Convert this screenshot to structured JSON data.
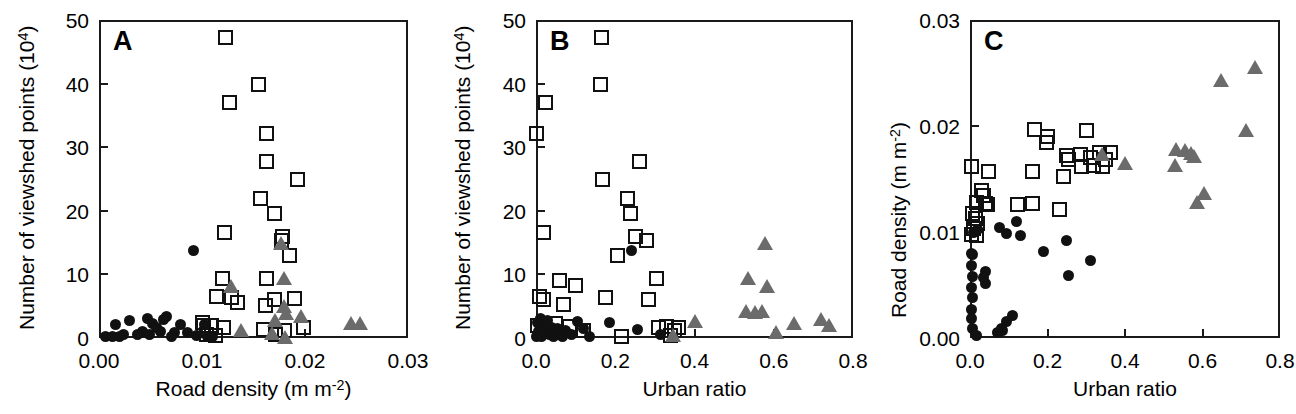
{
  "figure": {
    "background": "#ffffff",
    "marker_colors": {
      "square_outline": "#111111",
      "circle_fill": "#111111",
      "triangle_fill": "#6b6b6b",
      "axis": "#1a1a1a"
    }
  },
  "chart_data": [
    {
      "type": "scatter",
      "panel_label": "A",
      "title": "",
      "xlabel": "Road density (m m-2)",
      "xlabel_base": "Road density (m m",
      "xlabel_sup": "-2",
      "xlabel_tail": ")",
      "ylabel": "Number of viewshed points (104)",
      "ylabel_base": "Number of viewshed points (10",
      "ylabel_sup": "4",
      "ylabel_tail": ")",
      "xlim": [
        0.0,
        0.03
      ],
      "ylim": [
        0,
        50
      ],
      "xticks": [
        0.0,
        0.01,
        0.02,
        0.03
      ],
      "xtick_labels": [
        "0.00",
        "0.01",
        "0.02",
        "0.03"
      ],
      "yticks": [
        0,
        10,
        20,
        30,
        40,
        50
      ],
      "ytick_labels": [
        "0",
        "10",
        "20",
        "30",
        "40",
        "50"
      ],
      "grid": false,
      "legend": "none",
      "series": [
        {
          "name": "open-square",
          "marker": "square",
          "points": [
            [
              0.0123,
              47.2
            ],
            [
              0.0155,
              39.8
            ],
            [
              0.0127,
              37.0
            ],
            [
              0.0163,
              32.2
            ],
            [
              0.0163,
              27.8
            ],
            [
              0.0193,
              25.0
            ],
            [
              0.0157,
              21.9
            ],
            [
              0.017,
              19.6
            ],
            [
              0.0122,
              16.6
            ],
            [
              0.0178,
              16.0
            ],
            [
              0.0177,
              15.4
            ],
            [
              0.0185,
              12.9
            ],
            [
              0.012,
              9.3
            ],
            [
              0.0163,
              9.4
            ],
            [
              0.0114,
              6.5
            ],
            [
              0.0129,
              6.3
            ],
            [
              0.017,
              6.1
            ],
            [
              0.019,
              6.2
            ],
            [
              0.0134,
              5.6
            ],
            [
              0.0162,
              5.1
            ],
            [
              0.01,
              2.5
            ],
            [
              0.0101,
              2.0
            ],
            [
              0.0109,
              1.9
            ],
            [
              0.0121,
              1.6
            ],
            [
              0.016,
              1.3
            ],
            [
              0.018,
              1.2
            ],
            [
              0.0199,
              1.7
            ],
            [
              0.0104,
              0.6
            ],
            [
              0.0113,
              0.4
            ],
            [
              0.0171,
              0.5
            ]
          ]
        },
        {
          "name": "filled-circle",
          "marker": "circle",
          "points": [
            [
              0.0092,
              13.7
            ],
            [
              0.0066,
              3.4
            ],
            [
              0.0047,
              3.0
            ],
            [
              0.0063,
              2.9
            ],
            [
              0.003,
              2.8
            ],
            [
              0.0016,
              2.2
            ],
            [
              0.0052,
              2.3
            ],
            [
              0.0079,
              2.2
            ],
            [
              0.0056,
              1.6
            ],
            [
              0.0102,
              2.2
            ],
            [
              0.0042,
              1.1
            ],
            [
              0.006,
              1.0
            ],
            [
              0.0073,
              0.9
            ],
            [
              0.0086,
              0.8
            ],
            [
              0.0024,
              0.6
            ],
            [
              0.0037,
              0.5
            ],
            [
              0.0049,
              0.5
            ],
            [
              0.0006,
              0.2
            ],
            [
              0.0013,
              0.2
            ],
            [
              0.002,
              0.2
            ],
            [
              0.0095,
              0.4
            ],
            [
              0.0105,
              0.3
            ],
            [
              0.011,
              0.2
            ],
            [
              0.007,
              0.3
            ]
          ]
        },
        {
          "name": "filled-triangle",
          "marker": "triangle",
          "points": [
            [
              0.018,
              9.4
            ],
            [
              0.0128,
              8.1
            ],
            [
              0.0177,
              14.9
            ],
            [
              0.018,
              5.1
            ],
            [
              0.0182,
              4.0
            ],
            [
              0.0196,
              3.4
            ],
            [
              0.0171,
              2.9
            ],
            [
              0.0245,
              2.4
            ],
            [
              0.0253,
              2.4
            ],
            [
              0.0138,
              1.3
            ],
            [
              0.0168,
              0.8
            ],
            [
              0.0181,
              0.2
            ]
          ]
        }
      ]
    },
    {
      "type": "scatter",
      "panel_label": "B",
      "title": "",
      "xlabel": "Urban ratio",
      "ylabel": "Number of viewshed points (104)",
      "ylabel_base": "Number of viewshed points (10",
      "ylabel_sup": "4",
      "ylabel_tail": ")",
      "xlim": [
        0.0,
        0.8
      ],
      "ylim": [
        0,
        50
      ],
      "xticks": [
        0.0,
        0.2,
        0.4,
        0.6,
        0.8
      ],
      "xtick_labels": [
        "0.0",
        "0.2",
        "0.4",
        "0.6",
        "0.8"
      ],
      "yticks": [
        0,
        10,
        20,
        30,
        40,
        50
      ],
      "ytick_labels": [
        "0",
        "10",
        "20",
        "30",
        "40",
        "50"
      ],
      "grid": false,
      "legend": "none",
      "series": [
        {
          "name": "open-square",
          "marker": "square",
          "points": [
            [
              0.166,
              47.2
            ],
            [
              0.163,
              39.8
            ],
            [
              0.024,
              37.0
            ],
            [
              0.0,
              32.2
            ],
            [
              0.262,
              27.8
            ],
            [
              0.168,
              25.0
            ],
            [
              0.232,
              21.9
            ],
            [
              0.238,
              19.6
            ],
            [
              0.02,
              16.6
            ],
            [
              0.25,
              16.0
            ],
            [
              0.28,
              15.4
            ],
            [
              0.205,
              12.9
            ],
            [
              0.06,
              9.0
            ],
            [
              0.305,
              9.3
            ],
            [
              0.1,
              8.2
            ],
            [
              0.01,
              6.5
            ],
            [
              0.02,
              6.1
            ],
            [
              0.175,
              6.3
            ],
            [
              0.285,
              6.1
            ],
            [
              0.07,
              5.3
            ],
            [
              0.33,
              1.8
            ],
            [
              0.36,
              1.7
            ],
            [
              0.05,
              2.3
            ],
            [
              0.085,
              1.8
            ],
            [
              0.12,
              1.2
            ],
            [
              0.31,
              1.6
            ],
            [
              0.35,
              1.2
            ],
            [
              0.215,
              0.3
            ],
            [
              0.34,
              0.4
            ],
            [
              0.005,
              2.0
            ]
          ]
        },
        {
          "name": "filled-circle",
          "marker": "circle",
          "points": [
            [
              0.24,
              13.7
            ],
            [
              0.012,
              3.0
            ],
            [
              0.03,
              2.8
            ],
            [
              0.004,
              2.4
            ],
            [
              0.01,
              2.2
            ],
            [
              0.018,
              2.0
            ],
            [
              0.105,
              2.6
            ],
            [
              0.185,
              2.4
            ],
            [
              0.04,
              1.7
            ],
            [
              0.055,
              1.5
            ],
            [
              0.075,
              1.2
            ],
            [
              0.12,
              1.5
            ],
            [
              0.255,
              1.3
            ],
            [
              0.006,
              1.0
            ],
            [
              0.022,
              0.9
            ],
            [
              0.035,
              0.6
            ],
            [
              0.062,
              0.5
            ],
            [
              0.09,
              0.5
            ],
            [
              0.315,
              0.5
            ],
            [
              0.002,
              0.3
            ],
            [
              0.014,
              0.3
            ],
            [
              0.045,
              0.3
            ],
            [
              0.068,
              0.2
            ],
            [
              0.135,
              0.2
            ]
          ]
        },
        {
          "name": "filled-triangle",
          "marker": "triangle",
          "points": [
            [
              0.578,
              14.9
            ],
            [
              0.535,
              9.4
            ],
            [
              0.582,
              8.1
            ],
            [
              0.53,
              4.2
            ],
            [
              0.553,
              4.1
            ],
            [
              0.57,
              4.3
            ],
            [
              0.718,
              3.0
            ],
            [
              0.4,
              2.7
            ],
            [
              0.65,
              2.3
            ],
            [
              0.74,
              2.1
            ],
            [
              0.605,
              1.0
            ],
            [
              0.345,
              0.4
            ]
          ]
        }
      ]
    },
    {
      "type": "scatter",
      "panel_label": "C",
      "title": "",
      "xlabel": "Urban ratio",
      "ylabel": "Road density (m m-2)",
      "ylabel_base": "Road density (m m",
      "ylabel_sup": "-2",
      "ylabel_tail": ")",
      "xlim": [
        0.0,
        0.8
      ],
      "ylim": [
        0.0,
        0.03
      ],
      "xticks": [
        0.0,
        0.2,
        0.4,
        0.6,
        0.8
      ],
      "xtick_labels": [
        "0.0",
        "0.2",
        "0.4",
        "0.6",
        "0.8"
      ],
      "yticks": [
        0.0,
        0.01,
        0.02,
        0.03
      ],
      "ytick_labels": [
        "0.00",
        "0.01",
        "0.02",
        "0.03"
      ],
      "grid": false,
      "legend": "none",
      "series": [
        {
          "name": "open-square",
          "marker": "square",
          "points": [
            [
              0.166,
              0.0197
            ],
            [
              0.3,
              0.0196
            ],
            [
              0.2,
              0.019
            ],
            [
              0.198,
              0.0184
            ],
            [
              0.25,
              0.0172
            ],
            [
              0.285,
              0.0173
            ],
            [
              0.335,
              0.0175
            ],
            [
              0.362,
              0.0175
            ],
            [
              0.312,
              0.017
            ],
            [
              0.255,
              0.0168
            ],
            [
              0.288,
              0.0162
            ],
            [
              0.318,
              0.0163
            ],
            [
              0.342,
              0.0162
            ],
            [
              0.35,
              0.0168
            ],
            [
              0.005,
              0.0162
            ],
            [
              0.048,
              0.0157
            ],
            [
              0.16,
              0.0157
            ],
            [
              0.24,
              0.0152
            ],
            [
              0.03,
              0.0139
            ],
            [
              0.035,
              0.0134
            ],
            [
              0.018,
              0.0128
            ],
            [
              0.04,
              0.0127
            ],
            [
              0.045,
              0.0126
            ],
            [
              0.122,
              0.0126
            ],
            [
              0.16,
              0.0127
            ],
            [
              0.232,
              0.0121
            ],
            [
              0.006,
              0.0117
            ],
            [
              0.014,
              0.0113
            ],
            [
              0.02,
              0.0108
            ],
            [
              0.008,
              0.0103
            ],
            [
              0.004,
              0.0098
            ],
            [
              0.016,
              0.0097
            ]
          ]
        },
        {
          "name": "filled-circle",
          "marker": "circle",
          "points": [
            [
              0.12,
              0.011
            ],
            [
              0.075,
              0.0104
            ],
            [
              0.02,
              0.0102
            ],
            [
              0.095,
              0.0099
            ],
            [
              0.13,
              0.0097
            ],
            [
              0.008,
              0.01
            ],
            [
              0.25,
              0.0092
            ],
            [
              0.19,
              0.0082
            ],
            [
              0.312,
              0.0073
            ],
            [
              0.255,
              0.0059
            ],
            [
              0.005,
              0.008
            ],
            [
              0.007,
              0.0079
            ],
            [
              0.004,
              0.0068
            ],
            [
              0.006,
              0.0058
            ],
            [
              0.04,
              0.0063
            ],
            [
              0.036,
              0.0057
            ],
            [
              0.04,
              0.0051
            ],
            [
              0.004,
              0.0048
            ],
            [
              0.006,
              0.0038
            ],
            [
              0.005,
              0.0027
            ],
            [
              0.004,
              0.0018
            ],
            [
              0.11,
              0.0021
            ],
            [
              0.095,
              0.0016
            ],
            [
              0.08,
              0.0009
            ],
            [
              0.085,
              0.0007
            ],
            [
              0.018,
              0.0002
            ],
            [
              0.07,
              0.0005
            ],
            [
              0.006,
              0.0009
            ]
          ]
        },
        {
          "name": "filled-triangle",
          "marker": "triangle",
          "points": [
            [
              0.735,
              0.0256
            ],
            [
              0.648,
              0.0243
            ],
            [
              0.712,
              0.0196
            ],
            [
              0.532,
              0.0178
            ],
            [
              0.556,
              0.0177
            ],
            [
              0.57,
              0.0175
            ],
            [
              0.578,
              0.0172
            ],
            [
              0.34,
              0.0174
            ],
            [
              0.4,
              0.0165
            ],
            [
              0.528,
              0.0163
            ],
            [
              0.605,
              0.0137
            ],
            [
              0.585,
              0.0128
            ]
          ]
        }
      ]
    }
  ]
}
